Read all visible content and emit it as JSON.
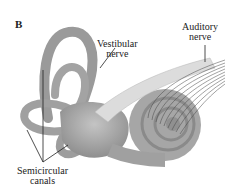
{
  "figure": {
    "panel_label": "B",
    "labels": {
      "vestibular_nerve": [
        "Vestibular",
        "nerve"
      ],
      "auditory_nerve": [
        "Auditory",
        "nerve"
      ],
      "semicircular_canals": [
        "Semicircular",
        "canals"
      ]
    },
    "colors": {
      "structure": "#a8a8a8",
      "structure_dark": "#7a7a7a",
      "nerve": "#d9d9d9",
      "line": "#222222"
    }
  }
}
